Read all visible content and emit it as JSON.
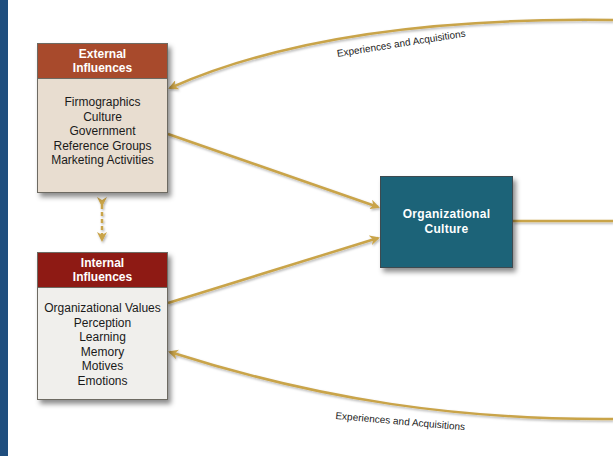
{
  "diagram": {
    "nodes": {
      "external": {
        "title_line1": "External",
        "title_line2": "Influences",
        "items": [
          "Firmographics",
          "Culture",
          "Government",
          "Reference Groups",
          "Marketing Activities"
        ]
      },
      "internal": {
        "title_line1": "Internal",
        "title_line2": "Influences",
        "items": [
          "Organizational Values",
          "Perception",
          "Learning",
          "Memory",
          "Motives",
          "Emotions"
        ]
      },
      "center": {
        "line1": "Organizational",
        "line2": "Culture"
      }
    },
    "edge_labels": {
      "top": "Experiences and Acquisitions",
      "bottom": "Experiences and Acquisitions"
    },
    "colors": {
      "left_strip": "#1f4e7e",
      "external_header": "#a84a2c",
      "external_body": "#e8ddd0",
      "internal_header": "#8e1a14",
      "internal_body": "#f0efec",
      "center_fill": "#1c6378",
      "arrow": "#c9a44a"
    }
  }
}
